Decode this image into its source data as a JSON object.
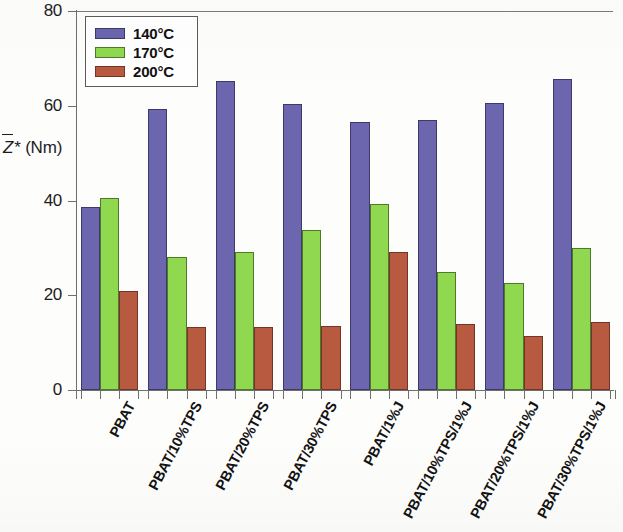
{
  "chart_data": {
    "type": "bar",
    "title": "",
    "xlabel": "",
    "ylabel": "Z̅* (Nm)",
    "ylabel_parts": {
      "symbol": "Z",
      "star": "*",
      "units": "(Nm)"
    },
    "ylim": [
      0,
      80
    ],
    "yticks": [
      0,
      20,
      40,
      60,
      80
    ],
    "ytick_labels": [
      "0",
      "20",
      "40",
      "60",
      "80"
    ],
    "grid": false,
    "legend_position": "top-left",
    "categories": [
      "PBAT",
      "PBAT/10%TPS",
      "PBAT/20%TPS",
      "PBAT/30%TPS",
      "PBAT/1%J",
      "PBAT/10%TPS/1%J",
      "PBAT/20%TPS/1%J",
      "PBAT/30%TPS/1%J"
    ],
    "series": [
      {
        "name": "140°C",
        "color": "#6b66ad",
        "values": [
          38.6,
          59.4,
          65.2,
          60.3,
          56.5,
          57.0,
          60.5,
          65.6
        ]
      },
      {
        "name": "170°C",
        "color": "#90d84f",
        "values": [
          40.5,
          28.0,
          29.2,
          33.8,
          39.2,
          25.0,
          22.6,
          29.9
        ]
      },
      {
        "name": "200°C",
        "color": "#b85a40",
        "values": [
          21.0,
          13.2,
          13.4,
          13.6,
          29.2,
          14.0,
          11.4,
          14.4
        ]
      }
    ]
  },
  "legend": {
    "entries": [
      {
        "label": "140°C",
        "color": "#6b66ad"
      },
      {
        "label": "170°C",
        "color": "#90d84f"
      },
      {
        "label": "200°C",
        "color": "#b85a40"
      }
    ]
  },
  "axes": {
    "y_title_symbol": "Z",
    "y_title_star": "*",
    "y_title_units": "(Nm)"
  }
}
